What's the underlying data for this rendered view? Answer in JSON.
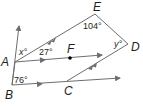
{
  "diagram": {
    "type": "geometry",
    "colors": {
      "line": "#6d6e71",
      "text": "#231f20",
      "point": "#000000"
    },
    "points": [
      {
        "name": "A",
        "label": "A"
      },
      {
        "name": "B",
        "label": "B"
      },
      {
        "name": "C",
        "label": "C"
      },
      {
        "name": "D",
        "label": "D"
      },
      {
        "name": "E",
        "label": "E"
      },
      {
        "name": "F",
        "label": "F"
      }
    ],
    "angles": {
      "x": "x°",
      "a27": "27°",
      "e104": "104°",
      "y": "y°",
      "b76": "76°"
    },
    "parallel_marks": {
      "single": [
        "AF ray",
        "BC ray"
      ],
      "double": [
        "AE",
        "CD"
      ]
    }
  }
}
